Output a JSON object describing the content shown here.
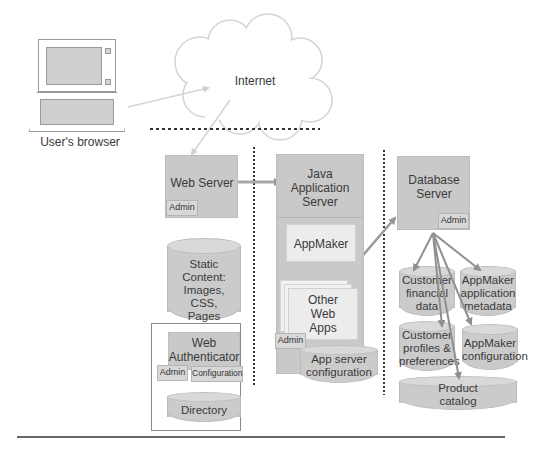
{
  "diagram": {
    "browser": {
      "label": "User's browser"
    },
    "internet": {
      "label": "Internet"
    },
    "web_server": {
      "title": "Web Server",
      "admin": "Admin"
    },
    "static_content": {
      "lines": [
        "Static Content:",
        "Images,",
        "CSS,",
        "Pages"
      ]
    },
    "web_authenticator": {
      "title_lines": [
        "Web",
        "Authenticator"
      ],
      "admin": "Admin",
      "configuration": "Configuration"
    },
    "directory": {
      "label": "Directory"
    },
    "java_app_server": {
      "title_lines": [
        "Java",
        "Application",
        "Server"
      ],
      "admin": "Admin"
    },
    "appmaker": {
      "label": "AppMaker"
    },
    "other_web_apps": {
      "lines": [
        "Other",
        "Web",
        "Apps"
      ]
    },
    "app_server_config": {
      "lines": [
        "App server",
        "configuration"
      ]
    },
    "database_server": {
      "title_lines": [
        "Database",
        "Server"
      ],
      "admin": "Admin"
    },
    "databases": {
      "customer_financial": {
        "lines": [
          "Customer",
          "financial",
          "data"
        ]
      },
      "appmaker_metadata": {
        "lines": [
          "AppMaker",
          "application",
          "metadata"
        ]
      },
      "customer_profiles": {
        "lines": [
          "Customer",
          "profiles &",
          "preferences"
        ]
      },
      "appmaker_config": {
        "lines": [
          "AppMaker",
          "configuration"
        ]
      },
      "product_catalog": {
        "lines": [
          "Product",
          "catalog"
        ]
      }
    },
    "colors": {
      "box_fill": "#c9c9c9",
      "inner_box_fill": "#ececec",
      "arrow": "#9a9a9a",
      "divider": "#333333"
    }
  }
}
